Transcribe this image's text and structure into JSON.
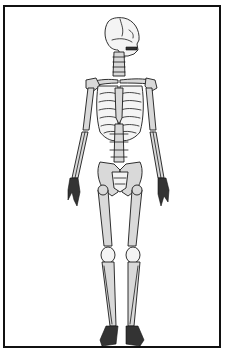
{
  "figure": {
    "style": "black line-art with light gray fill inside a black rectangular frame",
    "colors": {
      "background": "#ffffff",
      "frame": "#111111",
      "bone_fill": "#d9d9d9",
      "outline": "#1a1a1a"
    },
    "parts": [
      "skull",
      "cervical-spine",
      "clavicles",
      "scapulae",
      "sternum",
      "rib-cage",
      "humerus",
      "radius-ulna",
      "hands",
      "lumbar-spine",
      "pelvis",
      "sacrum",
      "femur",
      "patella",
      "tibia-fibula",
      "feet"
    ]
  }
}
